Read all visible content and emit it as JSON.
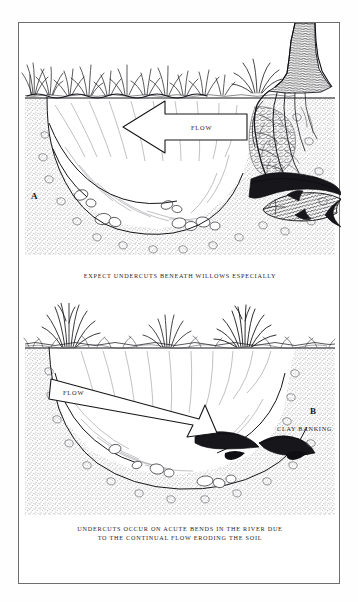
{
  "figure": {
    "medium": "pen-and-ink line drawing",
    "background_color": "#ffffff",
    "ink_color": "#1d1d22",
    "frame_color": "#6e6e6e"
  },
  "panel_a": {
    "letter": "A",
    "caption": "EXPECT UNDERCUTS BENEATH WILLOWS ESPECIALLY",
    "flow_label": "FLOW",
    "flow_direction": "left",
    "scene_elements": [
      "grass-tufts-left-bank",
      "willow-tree-trunk",
      "exposed-willow-roots",
      "waterline",
      "current-hatching",
      "undercut-bank-right",
      "fish",
      "riverbed-stones",
      "stippled-soil"
    ]
  },
  "panel_b": {
    "letter": "B",
    "caption_line_1": "UNDERCUTS OCCUR ON ACUTE BENDS IN THE RIVER DUE",
    "caption_line_2": "TO THE CONTINUAL FLOW ERODING THE SOIL",
    "flow_label": "FLOW",
    "flow_direction": "right-down",
    "clay_label": "CLAY BANKING",
    "scene_elements": [
      "grass-tuft-left",
      "grass-tuft-middle",
      "grass-tuft-right",
      "waterline",
      "current-hatching",
      "undercut-cavities",
      "riverbed-stones",
      "stippled-soil"
    ]
  }
}
